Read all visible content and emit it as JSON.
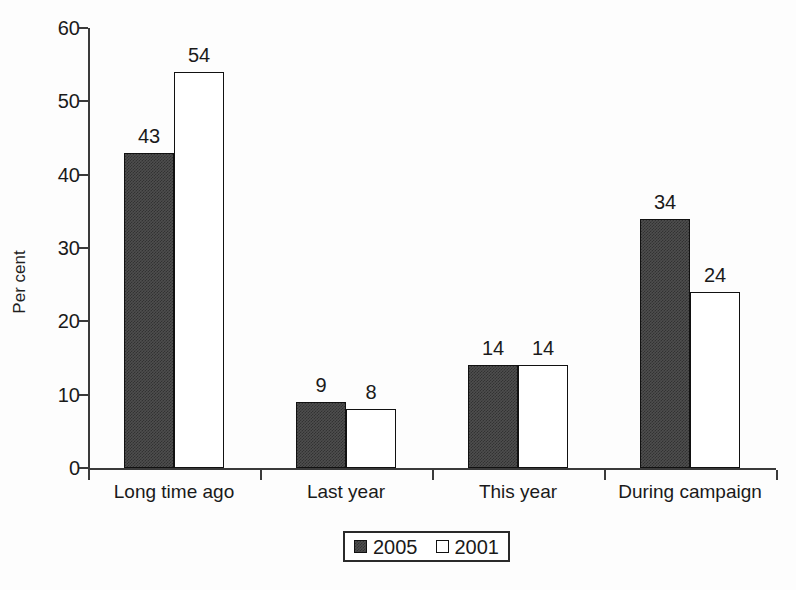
{
  "chart_data": {
    "type": "bar",
    "title": "",
    "xlabel": "",
    "ylabel": "Per cent",
    "ylim": [
      0,
      60
    ],
    "yticks": [
      0,
      10,
      20,
      30,
      40,
      50,
      60
    ],
    "ytick_labels": [
      "0",
      "10",
      "20",
      "30",
      "40",
      "50",
      "60"
    ],
    "grid": false,
    "legend_position": "bottom-center",
    "categories": [
      "Long time ago",
      "Last year",
      "This year",
      "During campaign"
    ],
    "series": [
      {
        "name": "2005",
        "color": "#4e4e4e",
        "fill": "dark-hatched",
        "values": [
          43,
          9,
          14,
          34
        ],
        "labels": [
          "43",
          "9",
          "14",
          "34"
        ]
      },
      {
        "name": "2001",
        "color": "#ffffff",
        "fill": "white-outlined",
        "values": [
          54,
          8,
          14,
          24
        ],
        "labels": [
          "54",
          "8",
          "14",
          "24"
        ]
      }
    ]
  },
  "legend": {
    "entries": [
      {
        "label": "2005",
        "swatch": "dark"
      },
      {
        "label": "2001",
        "swatch": "light"
      }
    ]
  },
  "axis": {
    "y_title": "Per cent"
  }
}
